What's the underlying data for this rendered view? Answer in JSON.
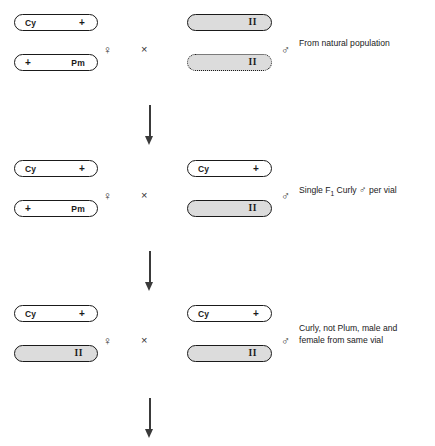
{
  "diagram": {
    "title": "Drosophila balancer cross scheme",
    "symbols": {
      "female": "♀",
      "male": "♂",
      "cross": "×"
    },
    "colors": {
      "line": "#1a1a1a",
      "fill_gray": "#dcdcdc",
      "background": "#ffffff",
      "arrow": "#3a3a3a"
    },
    "rows": [
      {
        "id": "generation-p",
        "female_parent": {
          "top_chromosome": {
            "left_label": "Cy",
            "right_label": "+",
            "fill": "white",
            "border": "solid"
          },
          "bottom_chromosome": {
            "left_label": "+",
            "right_label": "Pm",
            "fill": "white",
            "border": "solid"
          }
        },
        "male_parent": {
          "top_chromosome": {
            "left_label": "",
            "right_label": "II",
            "fill": "gray",
            "border": "solid"
          },
          "bottom_chromosome": {
            "left_label": "",
            "right_label": "II",
            "fill": "gray",
            "border": "dotted"
          }
        },
        "annotation_line1": "From natural population",
        "annotation_line2": ""
      },
      {
        "id": "generation-f1",
        "female_parent": {
          "top_chromosome": {
            "left_label": "Cy",
            "right_label": "+",
            "fill": "white",
            "border": "solid"
          },
          "bottom_chromosome": {
            "left_label": "+",
            "right_label": "Pm",
            "fill": "white",
            "border": "solid"
          }
        },
        "male_parent": {
          "top_chromosome": {
            "left_label": "Cy",
            "right_label": "+",
            "fill": "white",
            "border": "solid"
          },
          "bottom_chromosome": {
            "left_label": "",
            "right_label": "II",
            "fill": "gray",
            "border": "solid"
          }
        },
        "annotation_line1": "Single F1 Curly ♂ per vial",
        "annotation_line2": ""
      },
      {
        "id": "generation-f2",
        "female_parent": {
          "top_chromosome": {
            "left_label": "Cy",
            "right_label": "+",
            "fill": "white",
            "border": "solid"
          },
          "bottom_chromosome": {
            "left_label": "",
            "right_label": "II",
            "fill": "gray",
            "border": "solid"
          }
        },
        "male_parent": {
          "top_chromosome": {
            "left_label": "Cy",
            "right_label": "+",
            "fill": "white",
            "border": "solid"
          },
          "bottom_chromosome": {
            "left_label": "",
            "right_label": "II",
            "fill": "gray",
            "border": "solid"
          }
        },
        "annotation_line1": "Curly, not Plum, male and",
        "annotation_line2": "female from same vial"
      }
    ],
    "arrows": [
      {
        "id": "arrow-p-to-f1"
      },
      {
        "id": "arrow-f1-to-f2"
      },
      {
        "id": "arrow-f2-to-next"
      }
    ]
  }
}
